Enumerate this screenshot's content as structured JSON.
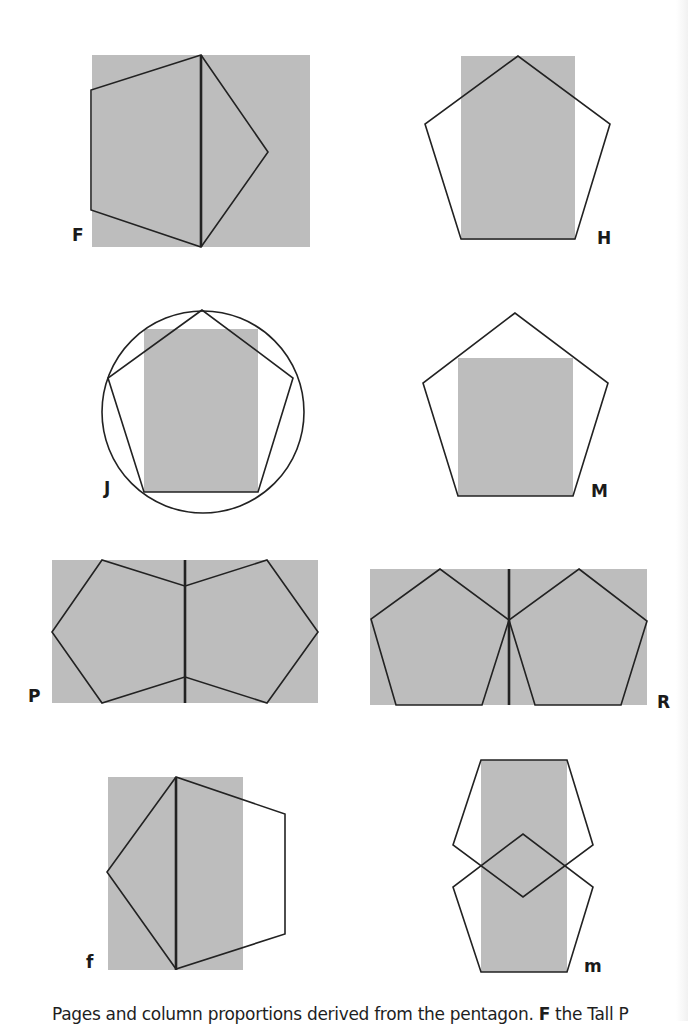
{
  "figure": {
    "fill_color": "#bdbdbd",
    "stroke_color": "#222222",
    "panels": [
      {
        "id": "F",
        "label": "F",
        "description": "Page rectangle with pentagon on its side, vertical axis through pentagon"
      },
      {
        "id": "H",
        "label": "H",
        "description": "Column rectangle inscribed in upright pentagon, width = pentagon base"
      },
      {
        "id": "J",
        "label": "J",
        "description": "Pentagon inscribed in circle with column rectangle from base"
      },
      {
        "id": "M",
        "label": "M",
        "description": "Shorter column rectangle within pentagon"
      },
      {
        "id": "P",
        "label": "P",
        "description": "Double-page spread with two mirrored sideways pentagons"
      },
      {
        "id": "R",
        "label": "R",
        "description": "Double-page spread with two upright pentagons meeting at spine"
      },
      {
        "id": "f",
        "label": "f",
        "description": "Tall page with sideways pentagon extending past right edge"
      },
      {
        "id": "m",
        "label": "m",
        "description": "Narrow column between two interlocking pentagons"
      }
    ]
  },
  "caption": {
    "text": "Pages and column proportions derived from the pentagon.",
    "visible_start": "Pages and column proportions derived from the pentagon.",
    "key_letter": "F",
    "key_text": "the Tall P"
  }
}
